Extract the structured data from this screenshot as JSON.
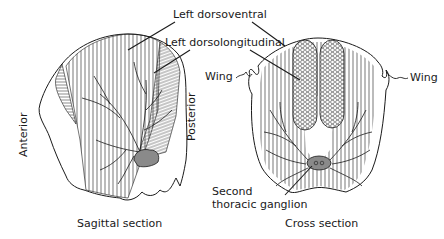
{
  "figure": {
    "type": "anatomical-diagram",
    "colors": {
      "ink": "#1a1a1a",
      "background": "#ffffff",
      "ganglion_fill": "#8a8a8a"
    }
  },
  "labels": {
    "left_dorsoventral": "Left dorsoventral",
    "left_dorsolongitudinal": "Left dorsolongitudinal",
    "wing_left": "Wing",
    "wing_right": "Wing",
    "anterior": "Anterior",
    "posterior": "Posterior",
    "second_thoracic_ganglion_line1": "Second",
    "second_thoracic_ganglion_line2": "thoracic ganglion"
  },
  "panels": [
    {
      "id": "sagittal",
      "caption": "Sagittal section"
    },
    {
      "id": "cross",
      "caption": "Cross section"
    }
  ]
}
